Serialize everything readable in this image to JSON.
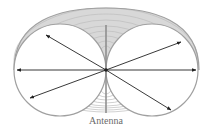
{
  "diagram": {
    "label": "Antenna",
    "colors": {
      "outline": "#a0a0a0",
      "fan": "#c4c4c4",
      "arrows": "#222222",
      "antenna": "#8a8a8a",
      "label": "#6b6b6b"
    },
    "center": [
      106,
      70
    ],
    "arrows": [
      {
        "from": [
          106,
          70
        ],
        "to": [
          17,
          70
        ]
      },
      {
        "from": [
          106,
          70
        ],
        "to": [
          196,
          70
        ]
      },
      {
        "from": [
          106,
          70
        ],
        "to": [
          46,
          35
        ]
      },
      {
        "from": [
          106,
          70
        ],
        "to": [
          181,
          42
        ]
      },
      {
        "from": [
          106,
          70
        ],
        "to": [
          30,
          98
        ]
      },
      {
        "from": [
          106,
          70
        ],
        "to": [
          171,
          110
        ]
      }
    ]
  }
}
